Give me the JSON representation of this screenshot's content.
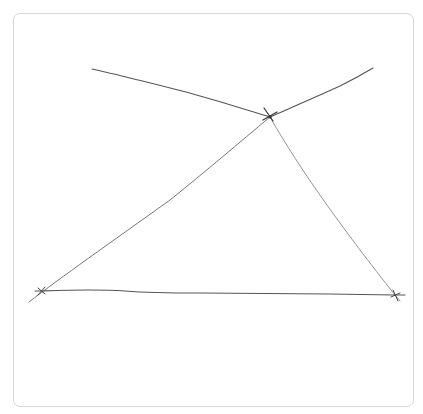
{
  "diagram": {
    "title": "",
    "colors": {
      "line": "#555555",
      "line_light": "#8a8a8a",
      "marker": "#333333",
      "card_border": "#d6d6d6"
    },
    "points": [
      {
        "id": "apex",
        "label": ""
      },
      {
        "id": "bottom-left",
        "label": ""
      },
      {
        "id": "bottom-right",
        "label": ""
      }
    ],
    "segments": [
      {
        "id": "upper-left-ray",
        "from": "top-left-end",
        "to": "apex"
      },
      {
        "id": "upper-right-ray",
        "from": "apex",
        "to": "top-right-end"
      },
      {
        "id": "left-side",
        "from": "bottom-left",
        "to": "apex"
      },
      {
        "id": "right-side",
        "from": "apex",
        "to": "bottom-right"
      },
      {
        "id": "base",
        "from": "bottom-left",
        "to": "bottom-right"
      }
    ]
  }
}
